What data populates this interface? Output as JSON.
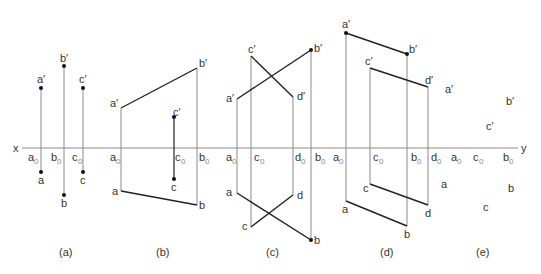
{
  "figure": {
    "axis": {
      "left_label": "x",
      "right_label": "y",
      "y": 148,
      "x_start": 22,
      "x_end": 518
    },
    "colors": {
      "axis": "#8a8a8a",
      "projector": "#8a8a8a",
      "edge": "#222222",
      "text": "#333333",
      "subscript": "#888888"
    },
    "panels": [
      {
        "id": "a",
        "caption": "(a)",
        "caption_x": 60
      },
      {
        "id": "b",
        "caption": "(b)",
        "caption_x": 161
      },
      {
        "id": "c",
        "caption": "(c)",
        "caption_x": 272
      },
      {
        "id": "d",
        "caption": "(d)",
        "caption_x": 381
      },
      {
        "id": "e",
        "caption": "(e)",
        "caption_x": 482
      }
    ],
    "labels": {
      "a_prime": "a′",
      "b_prime": "b′",
      "c_prime": "c′",
      "d_prime": "d′",
      "a": "a",
      "b": "b",
      "c": "c",
      "d": "d",
      "zero": "0"
    }
  }
}
